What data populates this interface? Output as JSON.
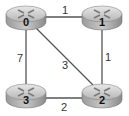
{
  "diagram": {
    "type": "network-graph",
    "nodes": [
      {
        "id": "0",
        "label": "0",
        "icon": "router-icon",
        "x": 26,
        "y": 17
      },
      {
        "id": "1",
        "label": "1",
        "icon": "router-icon",
        "x": 102,
        "y": 17
      },
      {
        "id": "2",
        "label": "2",
        "icon": "router-icon",
        "x": 102,
        "y": 95
      },
      {
        "id": "3",
        "label": "3",
        "icon": "router-icon",
        "x": 26,
        "y": 95
      }
    ],
    "edges": [
      {
        "from": "0",
        "to": "1",
        "weight": "1"
      },
      {
        "from": "1",
        "to": "2",
        "weight": "1"
      },
      {
        "from": "0",
        "to": "2",
        "weight": "3"
      },
      {
        "from": "0",
        "to": "3",
        "weight": "7"
      },
      {
        "from": "3",
        "to": "2",
        "weight": "2"
      }
    ]
  }
}
